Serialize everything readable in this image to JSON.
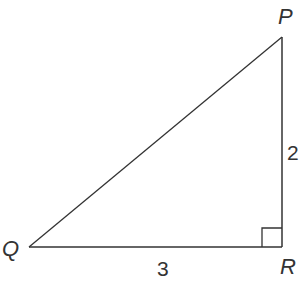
{
  "diagram": {
    "type": "right-triangle",
    "vertices": [
      {
        "id": "P",
        "label": "P",
        "x": 282,
        "y": 37
      },
      {
        "id": "Q",
        "label": "Q",
        "x": 29,
        "y": 247
      },
      {
        "id": "R",
        "label": "R",
        "x": 282,
        "y": 247
      }
    ],
    "sides": [
      {
        "from": "Q",
        "to": "R",
        "length_label": "3"
      },
      {
        "from": "R",
        "to": "P",
        "length_label": "2"
      },
      {
        "from": "Q",
        "to": "P",
        "length_label": ""
      }
    ],
    "right_angle_at": "R",
    "colors": {
      "stroke": "#333333",
      "background": "#ffffff"
    }
  }
}
